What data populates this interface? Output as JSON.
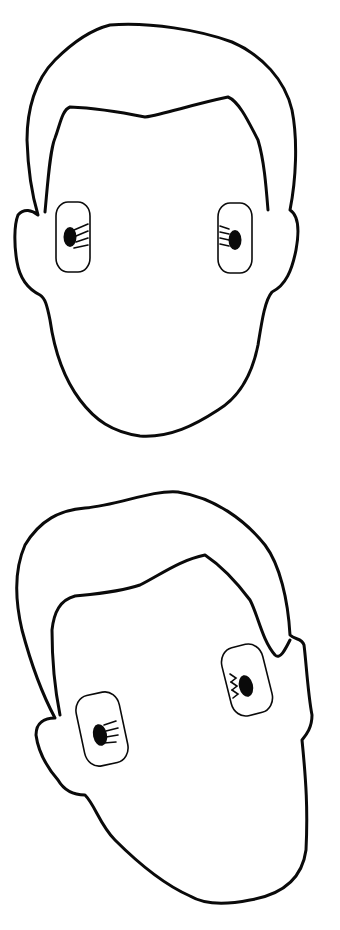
{
  "figure": {
    "faces": [
      {
        "label": "front-facing head",
        "orientation": "upright"
      },
      {
        "label": "tilted head",
        "orientation": "rotated clockwise"
      }
    ],
    "colors": {
      "line": "#0a0a0a",
      "background": "#ffffff"
    }
  }
}
